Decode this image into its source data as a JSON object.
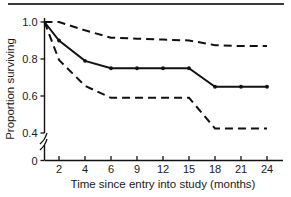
{
  "figure": {
    "name": "kaplan-meier-survival-curve",
    "top_rule": true
  },
  "chart_data": {
    "type": "line",
    "title": "",
    "subtitle": "",
    "xlabel": "Time since entry into study (months)",
    "ylabel": "Proportion surviving",
    "x_tick_labels": [
      "2",
      "4",
      "6",
      "9",
      "12",
      "15",
      "18",
      "21",
      "24"
    ],
    "x_tick_values": [
      2,
      4,
      6,
      9,
      12,
      15,
      18,
      21,
      24
    ],
    "x_axis_kind": "categorical-evenly-spaced",
    "y_tick_labels": [
      "0",
      "0.4",
      "0.6",
      "0.8",
      "1.0"
    ],
    "y_tick_values": [
      0,
      0.4,
      0.6,
      0.8,
      1.0
    ],
    "ylim": [
      0.35,
      1.02
    ],
    "y_axis_break": true,
    "y_axis_break_between": [
      0,
      0.4
    ],
    "grid": false,
    "legend": false,
    "legend_position": "none",
    "line_color": "#111111",
    "series": [
      {
        "name": "Survival estimate",
        "style": "solid",
        "markers": true,
        "x": [
          0,
          2,
          4,
          6,
          9,
          12,
          15,
          18,
          21,
          24
        ],
        "values": [
          1.0,
          0.9,
          0.79,
          0.75,
          0.75,
          0.75,
          0.75,
          0.65,
          0.65,
          0.65
        ]
      },
      {
        "name": "Upper 95% confidence limit",
        "style": "dashed",
        "markers": false,
        "x": [
          0,
          2,
          4,
          6,
          9,
          12,
          15,
          18,
          21,
          24
        ],
        "values": [
          1.0,
          1.0,
          0.955,
          0.915,
          0.91,
          0.905,
          0.9,
          0.875,
          0.87,
          0.87
        ]
      },
      {
        "name": "Lower 95% confidence limit",
        "style": "dashed",
        "markers": false,
        "x": [
          0,
          2,
          4,
          6,
          9,
          12,
          15,
          18,
          21,
          24
        ],
        "values": [
          1.0,
          0.795,
          0.655,
          0.59,
          0.59,
          0.59,
          0.59,
          0.425,
          0.425,
          0.425
        ]
      }
    ],
    "annotations": []
  }
}
